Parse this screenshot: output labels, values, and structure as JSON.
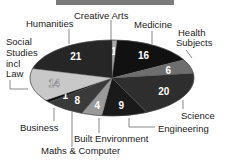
{
  "chart_data": {
    "type": "pie",
    "title": "",
    "slices": [
      {
        "label": "Creative Arts",
        "value": 1,
        "color": "#a8a8a8"
      },
      {
        "label": "Medicine",
        "value": 16,
        "color": "#111111"
      },
      {
        "label": "Health Subjects",
        "value": 6,
        "color": "#6e6e6e"
      },
      {
        "label": "Science",
        "value": 20,
        "color": "#2e2e2e"
      },
      {
        "label": "Engineering",
        "value": 9,
        "color": "#1a1a1a"
      },
      {
        "label": "Built Environment",
        "value": 4,
        "color": "#9a9a9a"
      },
      {
        "label": "Maths & Computer",
        "value": 8,
        "color": "#3a3a3a"
      },
      {
        "label": "Business",
        "value": 1,
        "color": "#0c0c0c"
      },
      {
        "label": "Social Studies incl Law",
        "value": 14,
        "color": "#c8c8c8"
      },
      {
        "label": "Humanities",
        "value": 21,
        "color": "#262626"
      }
    ]
  },
  "labels": {
    "creative_arts": "Creative Arts",
    "medicine": "Medicine",
    "health_1": "Health",
    "health_2": "Subjects",
    "science": "Science",
    "engineering": "Engineering",
    "built_env": "Built Environment",
    "maths": "Maths & Computer",
    "business": "Business",
    "social_1": "Social",
    "social_2": "Studies",
    "social_3": "incl",
    "social_4": "Law",
    "humanities": "Humanities"
  }
}
